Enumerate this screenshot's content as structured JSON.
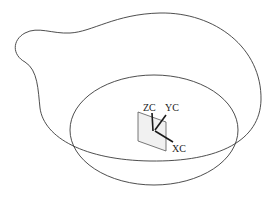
{
  "diagram": {
    "type": "cad-sketch",
    "elements": [
      {
        "id": "outer-spline",
        "kind": "closed-spline-curve"
      },
      {
        "id": "inner-ellipse",
        "kind": "ellipse"
      },
      {
        "id": "wcs",
        "kind": "coordinate-system"
      }
    ]
  },
  "wcs": {
    "labels": {
      "z": "ZC",
      "y": "YC",
      "x": "XC"
    }
  },
  "colors": {
    "background": "#ffffff",
    "curve": "#3a3a3a",
    "axis": "#1a1a1a",
    "plane_fill": "#f1f1f1"
  }
}
